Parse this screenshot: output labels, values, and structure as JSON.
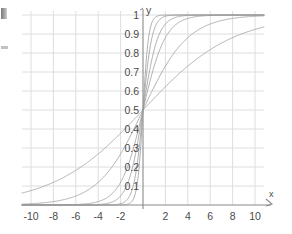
{
  "chart_data": {
    "type": "line",
    "title": "",
    "subtitle": "",
    "xlabel": "x",
    "ylabel": "y",
    "xlim": [
      -10.8,
      10.8
    ],
    "ylim": [
      0,
      1.04
    ],
    "grid": true,
    "legend_position": "none",
    "x_ticks": [
      -10,
      -8,
      -6,
      -4,
      -2,
      2,
      4,
      6,
      8,
      10
    ],
    "x_tick_labels": [
      "-10",
      "-8",
      "-6",
      "-4",
      "-2",
      "2",
      "4",
      "6",
      "8",
      "10"
    ],
    "y_ticks": [
      0.1,
      0.2,
      0.3,
      0.4,
      0.5,
      0.6,
      0.7,
      0.8,
      0.9,
      1
    ],
    "y_tick_labels": [
      "0.1",
      "0.2",
      "0.3",
      "0.4",
      "0.5",
      "0.6",
      "0.7",
      "0.8",
      "0.9",
      "1"
    ],
    "x_gridlines": [
      -10,
      -8,
      -6,
      -4,
      -2,
      0,
      2,
      4,
      6,
      8,
      10
    ],
    "y_gridlines": [
      0.1,
      0.2,
      0.3,
      0.4,
      0.5,
      0.6,
      0.7,
      0.8,
      0.9,
      1
    ],
    "axis_arrow_x": true,
    "axis_arrow_y": false,
    "function_form": "y = 1 / (1 + exp(-k*x))",
    "series": [
      {
        "name": "k = 0.25",
        "k": 0.25,
        "color": "#9a9a9a"
      },
      {
        "name": "k = 0.5",
        "k": 0.5,
        "color": "#9a9a9a"
      },
      {
        "name": "k = 1",
        "k": 1,
        "color": "#9a9a9a"
      },
      {
        "name": "k = 1.5",
        "k": 1.5,
        "color": "#9a9a9a"
      },
      {
        "name": "k = 2.5",
        "k": 2.5,
        "color": "#9a9a9a"
      },
      {
        "name": "k = 4",
        "k": 4,
        "color": "#9a9a9a"
      }
    ],
    "colors": {
      "background": "#ffffff",
      "grid": "#dedede",
      "axis": "#8a8a8a",
      "curve": "#9a9a9a",
      "tick_label": "#4a4a4a"
    }
  },
  "axes": {
    "y_axis_label": "y",
    "x_axis_label": "x"
  },
  "artifacts": {
    "top_mark": "scan-artifact-top",
    "mid_mark": "scan-artifact-mid"
  }
}
